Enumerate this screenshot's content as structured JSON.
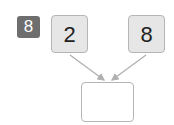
{
  "problem": {
    "number": "8"
  },
  "parts": [
    {
      "value": "2"
    },
    {
      "value": "8"
    }
  ],
  "whole": {
    "value": ""
  },
  "colors": {
    "badge": "#6e6e6e",
    "box_fill": "#e6e6e6",
    "border": "#b5b5b5",
    "arrow": "#b0b0b0"
  }
}
